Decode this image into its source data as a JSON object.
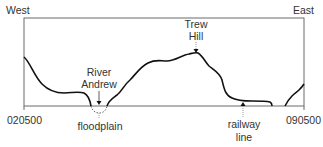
{
  "diagram": {
    "type": "cross-section profile",
    "orientation": {
      "left": "West",
      "right": "East"
    },
    "grid_refs": {
      "start": "020500",
      "end": "090500"
    },
    "annotations": [
      {
        "id": "river",
        "lines": [
          "River",
          "Andrew"
        ],
        "points_to": "river channel"
      },
      {
        "id": "hill",
        "lines": [
          "Trew",
          "Hill"
        ],
        "points_to": "summit"
      },
      {
        "id": "floodplain",
        "lines": [
          "floodplain"
        ],
        "points_to": "channel below baseline"
      },
      {
        "id": "railway",
        "lines": [
          "railway",
          "line"
        ],
        "points_to": "flat valley floor"
      }
    ],
    "colors": {
      "frame": "#6b6b6b",
      "profile": "#111111",
      "text": "#333333"
    }
  }
}
